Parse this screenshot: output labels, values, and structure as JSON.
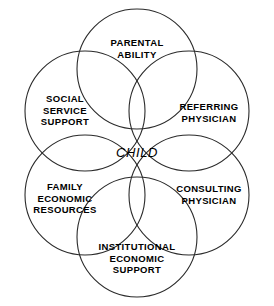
{
  "diagram": {
    "type": "venn-rosette",
    "title": "CHILD",
    "stroke_color": "#2a2a2a",
    "background_color": "#ffffff",
    "text_color": "#000000",
    "center": {
      "label": "CHILD",
      "x": 137,
      "y": 153
    },
    "circles": [
      {
        "id": "parental-ability",
        "label": "PARENTAL\nABILITY",
        "cx": 137,
        "cy": 69,
        "r": 60,
        "label_x": 137,
        "label_y": 48
      },
      {
        "id": "referring-physician",
        "label": "REFERRING\nPHYSICIAN",
        "cx": 189,
        "cy": 111,
        "r": 60,
        "label_x": 209,
        "label_y": 112
      },
      {
        "id": "consulting-physician",
        "label": "CONSULTING\nPHYSICIAN",
        "cx": 189,
        "cy": 195,
        "r": 60,
        "label_x": 209,
        "label_y": 194
      },
      {
        "id": "institutional-economic-support",
        "label": "INSTITUTIONAL\nECONOMIC\nSUPPORT",
        "cx": 137,
        "cy": 237,
        "r": 60,
        "label_x": 137,
        "label_y": 258
      },
      {
        "id": "family-economic-resources",
        "label": "FAMILY\nECONOMIC\nRESOURCES",
        "cx": 85,
        "cy": 195,
        "r": 60,
        "label_x": 65,
        "label_y": 198
      },
      {
        "id": "social-service-support",
        "label": "SOCIAL\nSERVICE\nSUPPORT",
        "cx": 85,
        "cy": 111,
        "r": 60,
        "label_x": 65,
        "label_y": 110
      }
    ]
  }
}
